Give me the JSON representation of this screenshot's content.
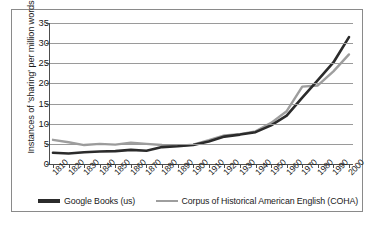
{
  "chart_data": {
    "type": "line",
    "title": "",
    "xlabel": "",
    "ylabel": "Instances of 'sharing' per million words",
    "ylim": [
      0,
      35
    ],
    "yticks": [
      0,
      5,
      10,
      15,
      20,
      25,
      30,
      35
    ],
    "grid": true,
    "legend_position": "bottom",
    "categories": [
      "1810",
      "1820",
      "1830",
      "1840",
      "1850",
      "1860",
      "1870",
      "1880",
      "1890",
      "1900",
      "1910",
      "1920",
      "1930",
      "1940",
      "1950",
      "1960",
      "1970",
      "1980",
      "1990",
      "2000"
    ],
    "series": [
      {
        "name": "Google Books (us)",
        "color": "#2b2b2b",
        "values": [
          2.8,
          2.6,
          2.9,
          3.1,
          3.2,
          3.5,
          3.3,
          4.2,
          4.4,
          4.7,
          5.6,
          6.8,
          7.3,
          7.9,
          9.6,
          12.0,
          16.5,
          20.8,
          25.2,
          31.5
        ]
      },
      {
        "name": "Corpus of Historical American English (COHA)",
        "color": "#9e9e9e",
        "values": [
          6.0,
          5.4,
          4.7,
          5.0,
          4.8,
          5.3,
          5.0,
          4.7,
          4.5,
          4.8,
          5.9,
          7.1,
          7.4,
          8.1,
          10.2,
          13.1,
          19.2,
          19.5,
          23.0,
          27.2
        ]
      }
    ]
  },
  "legend": {
    "items": [
      {
        "label": "Google Books (us)",
        "color": "#2b2b2b"
      },
      {
        "label": "Corpus of Historical American English (COHA)",
        "color": "#9e9e9e"
      }
    ]
  }
}
